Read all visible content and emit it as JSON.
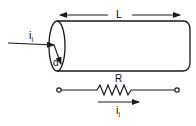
{
  "diagram": {
    "labels": {
      "length": "L",
      "diameter": "d",
      "resistance": "R",
      "current_in": "i",
      "current_in_sub": "l",
      "current_resistor": "i",
      "current_resistor_sub": "l"
    },
    "colors": {
      "stroke": "#1a1a1a",
      "background": "#ffffff"
    }
  }
}
